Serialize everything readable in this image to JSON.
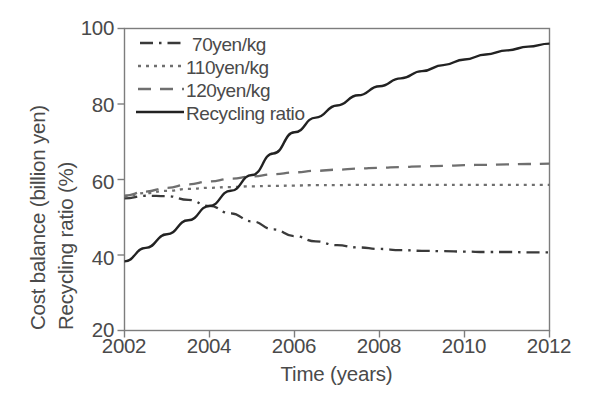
{
  "chart_data": {
    "type": "line",
    "title": "",
    "xlabel": "Time (years)",
    "ylabel_line1": "Cost balance (billion yen)",
    "ylabel_line2": "Recycling ratio (%)",
    "xlim": [
      2002,
      2012
    ],
    "ylim": [
      20,
      100
    ],
    "xticks": [
      "2002",
      "2004",
      "2006",
      "2008",
      "2010",
      "2012"
    ],
    "xtick_values": [
      2002,
      2004,
      2006,
      2008,
      2010,
      2012
    ],
    "yticks": [
      "20",
      "40",
      "60",
      "80",
      "100"
    ],
    "ytick_values": [
      20,
      40,
      60,
      80,
      100
    ],
    "grid": false,
    "legend_position": "top-left-inside",
    "x": [
      2002,
      2002.5,
      2003,
      2003.5,
      2004,
      2004.5,
      2005,
      2005.5,
      2006,
      2006.5,
      2007,
      2007.5,
      2008,
      2008.5,
      2009,
      2009.5,
      2010,
      2010.5,
      2011,
      2011.5,
      2012
    ],
    "series": [
      {
        "name": "70yen/kg",
        "style": "dash-dot",
        "color": "#3a3a3a",
        "values": [
          55.0,
          55.7,
          55.6,
          54.6,
          53.0,
          51.0,
          48.9,
          46.8,
          45.0,
          43.6,
          42.6,
          42.0,
          41.6,
          41.3,
          41.1,
          41.0,
          40.9,
          40.8,
          40.8,
          40.7,
          40.7
        ]
      },
      {
        "name": "110yen/kg",
        "style": "dotted",
        "color": "#6f6f6f",
        "values": [
          55.6,
          56.4,
          57.0,
          57.5,
          57.8,
          58.0,
          58.2,
          58.3,
          58.4,
          58.5,
          58.5,
          58.6,
          58.6,
          58.6,
          58.6,
          58.6,
          58.6,
          58.6,
          58.6,
          58.6,
          58.6
        ]
      },
      {
        "name": "120yen/kg",
        "style": "dashed",
        "color": "#6f6f6f",
        "values": [
          55.7,
          56.8,
          57.8,
          58.7,
          59.5,
          60.2,
          60.8,
          61.4,
          61.9,
          62.3,
          62.6,
          62.9,
          63.1,
          63.3,
          63.5,
          63.6,
          63.8,
          63.9,
          64.0,
          64.1,
          64.2
        ]
      },
      {
        "name": "Recycling ratio",
        "style": "solid",
        "color": "#222222",
        "values": [
          38.3,
          41.9,
          45.5,
          49.2,
          53.0,
          57.0,
          61.2,
          66.9,
          72.5,
          76.4,
          79.6,
          82.3,
          84.7,
          86.8,
          88.7,
          90.3,
          91.8,
          93.1,
          94.2,
          95.2,
          96.0
        ]
      }
    ]
  },
  "legend": {
    "items": [
      {
        "label": "70yen/kg",
        "style": "dash-dot"
      },
      {
        "label": "110yen/kg",
        "style": "dotted"
      },
      {
        "label": "120yen/kg",
        "style": "dashed"
      },
      {
        "label": "Recycling ratio",
        "style": "solid"
      }
    ]
  },
  "axes": {
    "y_label_line1": "Cost balance (billion yen)",
    "y_label_line2": "Recycling ratio (%)",
    "x_label": "Time (years)",
    "y_tick_100": "100",
    "y_tick_80": "80",
    "y_tick_60": "60",
    "y_tick_40": "40",
    "y_tick_20": "20",
    "x_tick_2002": "2002",
    "x_tick_2004": "2004",
    "x_tick_2006": "2006",
    "x_tick_2008": "2008",
    "x_tick_2010": "2010",
    "x_tick_2012": "2012"
  },
  "colors": {
    "axis": "#7d7d7d",
    "text": "#4a4a4a",
    "solid_line": "#222222",
    "dashed_line": "#6f6f6f",
    "dotted_line": "#6f6f6f",
    "dashdot_line": "#3a3a3a",
    "background": "#ffffff"
  }
}
